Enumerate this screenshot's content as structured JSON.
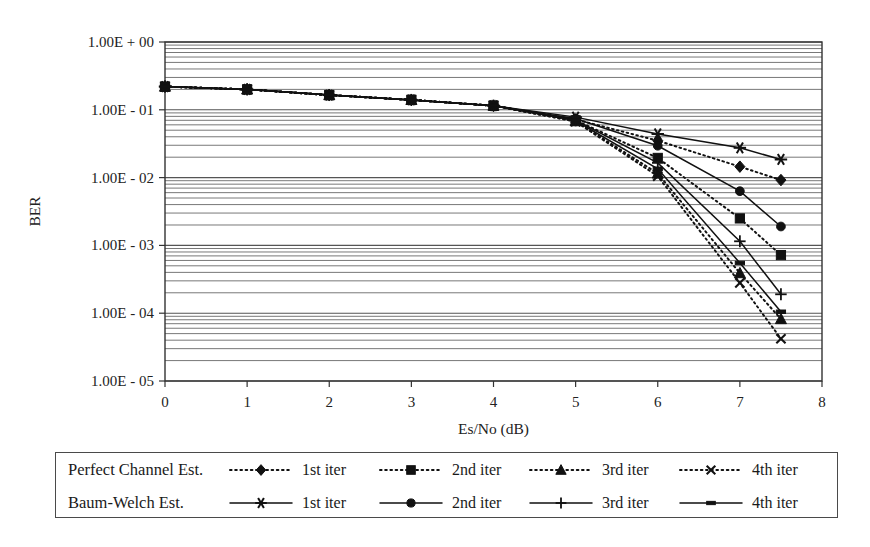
{
  "chart_data": {
    "type": "line",
    "title": "",
    "xlabel": "Es/No (dB)",
    "ylabel": "BER",
    "xlim": [
      0,
      8
    ],
    "ylim": [
      1e-05,
      1
    ],
    "yscale": "log",
    "grid": true,
    "grid_minor": true,
    "legend_position": "below",
    "xticks": [
      "0",
      "1",
      "2",
      "3",
      "4",
      "5",
      "6",
      "7",
      "8"
    ],
    "xtick_values": [
      0,
      1,
      2,
      3,
      4,
      5,
      6,
      7,
      8
    ],
    "yticks": [
      "1.00E + 00",
      "1.00E - 01",
      "1.00E - 02",
      "1.00E - 03",
      "1.00E - 04",
      "1.00E - 05"
    ],
    "ytick_values": [
      1,
      0.1,
      0.01,
      0.001,
      0.0001,
      1e-05
    ],
    "legend_groups": [
      {
        "name": "Perfect Channel Est.",
        "style": "dotted"
      },
      {
        "name": "Baum-Welch Est.",
        "style": "solid"
      }
    ],
    "series": [
      {
        "name": "1st iter",
        "group": "Perfect Channel Est.",
        "style": "dotted",
        "marker": "diamond",
        "x": [
          0,
          1,
          2,
          3,
          4,
          5,
          6,
          7,
          7.5
        ],
        "values": [
          0.22,
          0.2,
          0.165,
          0.14,
          0.115,
          0.072,
          0.035,
          0.0145,
          0.0092
        ]
      },
      {
        "name": "2nd iter",
        "group": "Perfect Channel Est.",
        "style": "dotted",
        "marker": "square",
        "x": [
          0,
          1,
          2,
          3,
          4,
          5,
          6,
          7,
          7.5
        ],
        "values": [
          0.22,
          0.2,
          0.165,
          0.14,
          0.115,
          0.07,
          0.0195,
          0.0025,
          0.00072
        ]
      },
      {
        "name": "3rd iter",
        "group": "Perfect Channel Est.",
        "style": "dotted",
        "marker": "triangle",
        "x": [
          0,
          1,
          2,
          3,
          4,
          5,
          6,
          7,
          7.5
        ],
        "values": [
          0.22,
          0.2,
          0.165,
          0.14,
          0.115,
          0.068,
          0.0115,
          0.00039,
          8.2e-05
        ]
      },
      {
        "name": "4th iter",
        "group": "Perfect Channel Est.",
        "style": "dotted",
        "marker": "cross",
        "x": [
          0,
          1,
          2,
          3,
          4,
          5,
          6,
          7,
          7.5
        ],
        "values": [
          0.22,
          0.2,
          0.165,
          0.14,
          0.115,
          0.067,
          0.0105,
          0.00028,
          4.2e-05
        ]
      },
      {
        "name": "1st iter",
        "group": "Baum-Welch Est.",
        "style": "solid",
        "marker": "asterisk",
        "x": [
          0,
          1,
          2,
          3,
          4,
          5,
          6,
          7,
          7.5
        ],
        "values": [
          0.22,
          0.2,
          0.165,
          0.14,
          0.115,
          0.078,
          0.044,
          0.0275,
          0.0185
        ]
      },
      {
        "name": "2nd iter",
        "group": "Baum-Welch Est.",
        "style": "solid",
        "marker": "circle",
        "x": [
          0,
          1,
          2,
          3,
          4,
          5,
          6,
          7,
          7.5
        ],
        "values": [
          0.22,
          0.2,
          0.165,
          0.14,
          0.115,
          0.074,
          0.0295,
          0.0063,
          0.0019
        ]
      },
      {
        "name": "3rd iter",
        "group": "Baum-Welch Est.",
        "style": "solid",
        "marker": "plus",
        "x": [
          0,
          1,
          2,
          3,
          4,
          5,
          6,
          7,
          7.5
        ],
        "values": [
          0.22,
          0.2,
          0.165,
          0.14,
          0.115,
          0.07,
          0.0165,
          0.00115,
          0.00019
        ]
      },
      {
        "name": "4th iter",
        "group": "Baum-Welch Est.",
        "style": "solid",
        "marker": "dash",
        "x": [
          0,
          1,
          2,
          3,
          4,
          5,
          6,
          7,
          7.5
        ],
        "values": [
          0.22,
          0.2,
          0.165,
          0.14,
          0.115,
          0.069,
          0.0135,
          0.00055,
          0.000105
        ]
      }
    ]
  },
  "legend": {
    "row1": {
      "title": "Perfect Channel Est.",
      "items": [
        {
          "label": "1st iter",
          "marker": "diamond",
          "style": "dotted"
        },
        {
          "label": "2nd iter",
          "marker": "square",
          "style": "dotted"
        },
        {
          "label": "3rd iter",
          "marker": "triangle",
          "style": "dotted"
        },
        {
          "label": "4th iter",
          "marker": "cross",
          "style": "dotted"
        }
      ]
    },
    "row2": {
      "title": "Baum-Welch Est.",
      "items": [
        {
          "label": "1st iter",
          "marker": "asterisk",
          "style": "solid"
        },
        {
          "label": "2nd iter",
          "marker": "circle",
          "style": "solid"
        },
        {
          "label": "3rd iter",
          "marker": "plus",
          "style": "solid"
        },
        {
          "label": "4th iter",
          "marker": "dash",
          "style": "solid"
        }
      ]
    }
  },
  "colors": {
    "line": "#111111",
    "grid": "#555555",
    "axis": "#333333",
    "text": "#1a1a1a",
    "background": "#ffffff"
  }
}
